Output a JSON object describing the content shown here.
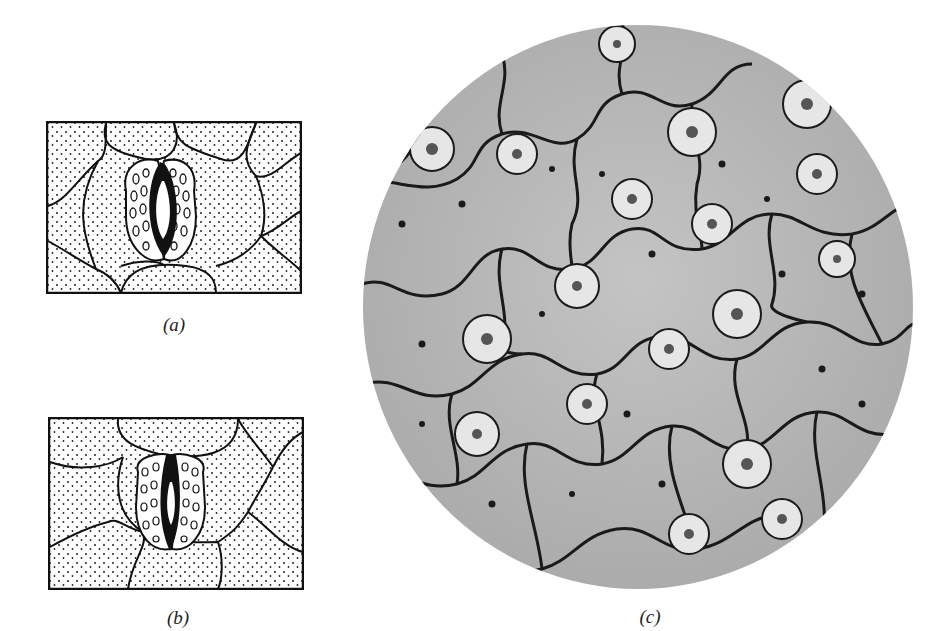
{
  "figure": {
    "panels": [
      {
        "id": "a",
        "label": "(a)",
        "description": "Stoma with guard cells, pore open"
      },
      {
        "id": "b",
        "label": "(b)",
        "description": "Stoma with guard cells, pore nearly closed"
      },
      {
        "id": "c",
        "label": "(c)",
        "description": "Micrograph of leaf epidermis showing stomata"
      }
    ],
    "colors": {
      "ink": "#111111",
      "paper": "#ffffff",
      "micrograph_bg": "#b9b9b9",
      "cell_wall": "#1a1a1a"
    }
  }
}
